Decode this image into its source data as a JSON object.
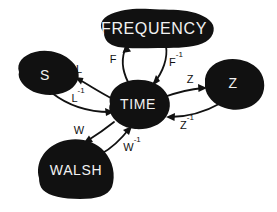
{
  "diagram": {
    "background_color": "#ffffff",
    "node_color": "#111111",
    "node_text_color": "#f2f2f2",
    "edge_color": "#111111",
    "nodes": [
      {
        "id": "frequency",
        "label": "FREQUENCY",
        "cx": 152,
        "cy": 30
      },
      {
        "id": "s",
        "label": "S",
        "cx": 48,
        "cy": 78
      },
      {
        "id": "time",
        "label": "TIME",
        "cx": 136,
        "cy": 104
      },
      {
        "id": "z",
        "label": "Z",
        "cx": 231,
        "cy": 87
      },
      {
        "id": "walsh",
        "label": "WALSH",
        "cx": 80,
        "cy": 170
      }
    ],
    "edges": [
      {
        "id": "f",
        "from": "time",
        "to": "frequency",
        "base": "F",
        "sup": "",
        "label": "F",
        "lx": 113,
        "ly": 60
      },
      {
        "id": "f-inv",
        "from": "frequency",
        "to": "time",
        "base": "F",
        "sup": "-1",
        "label": "F-1",
        "lx": 175,
        "ly": 63
      },
      {
        "id": "l",
        "from": "time",
        "to": "s",
        "base": "L",
        "sup": "",
        "label": "L",
        "lx": 78,
        "ly": 71
      },
      {
        "id": "l-inv",
        "from": "s",
        "to": "time",
        "base": "L",
        "sup": "-1",
        "label": "L-1",
        "lx": 77,
        "ly": 99
      },
      {
        "id": "z",
        "from": "time",
        "to": "z",
        "base": "Z",
        "sup": "",
        "label": "Z",
        "lx": 190,
        "ly": 82
      },
      {
        "id": "z-inv",
        "from": "z",
        "to": "time",
        "base": "Z",
        "sup": "-1",
        "label": "Z-1",
        "lx": 186,
        "ly": 125
      },
      {
        "id": "w",
        "from": "time",
        "to": "walsh",
        "base": "W",
        "sup": "",
        "label": "W",
        "lx": 79,
        "ly": 132
      },
      {
        "id": "w-inv",
        "from": "walsh",
        "to": "time",
        "base": "W",
        "sup": "-1",
        "label": "W-1",
        "lx": 131,
        "ly": 148
      }
    ]
  }
}
